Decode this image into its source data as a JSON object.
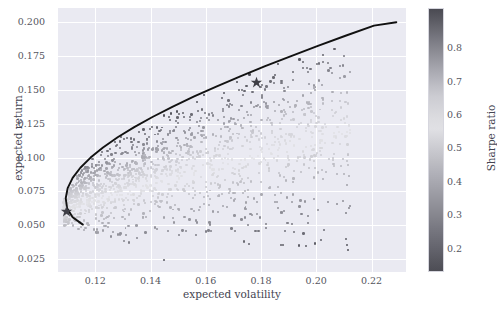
{
  "chart_data": {
    "type": "scatter",
    "title": "",
    "xlabel": "expected volatility",
    "ylabel": "expected return",
    "xlim": [
      0.1065,
      0.2325
    ],
    "ylim": [
      0.0155,
      0.2105
    ],
    "xticks": [
      "0.12",
      "0.14",
      "0.16",
      "0.18",
      "0.20",
      "0.22"
    ],
    "xtick_values": [
      0.12,
      0.14,
      0.16,
      0.18,
      0.2,
      0.22
    ],
    "yticks": [
      "0.025",
      "0.050",
      "0.075",
      "0.100",
      "0.125",
      "0.150",
      "0.175",
      "0.200"
    ],
    "ytick_values": [
      0.025,
      0.05,
      0.075,
      0.1,
      0.125,
      0.15,
      0.175,
      0.2
    ],
    "grid": true,
    "background": "#eaeaf2",
    "gridline_color": "#ffffff",
    "colorbar": {
      "label": "Sharpe ratio",
      "ticks": [
        "0.8",
        "0.7",
        "0.6",
        "0.5",
        "0.4",
        "0.3",
        "0.2"
      ],
      "tick_values": [
        0.8,
        0.7,
        0.6,
        0.5,
        0.4,
        0.3,
        0.2
      ],
      "vmin": 0.13,
      "vmax": 0.92,
      "colormap": "grayscale-diverging",
      "position": "right",
      "stops": [
        {
          "pos": 0.0,
          "color": "#4d4d55"
        },
        {
          "pos": 0.18,
          "color": "#7d7d86"
        },
        {
          "pos": 0.4,
          "color": "#b8b8bf"
        },
        {
          "pos": 0.55,
          "color": "#e2e2e6"
        },
        {
          "pos": 0.68,
          "color": "#c9c9d0"
        },
        {
          "pos": 0.84,
          "color": "#8b8b94"
        },
        {
          "pos": 1.0,
          "color": "#4a4a52"
        }
      ]
    },
    "series": [
      {
        "name": "random portfolios",
        "marker": "circle",
        "colored_by": "Sharpe ratio",
        "n_points": 3000,
        "x_range": [
          0.108,
          0.213
        ],
        "y_range": [
          0.024,
          0.172
        ],
        "description": "cloud of randomly weighted portfolios shaded by Sharpe ratio"
      },
      {
        "name": "efficient frontier",
        "marker": "line",
        "color": "#111111",
        "linewidth": 1.8,
        "points": [
          [
            0.1155,
            0.0505
          ],
          [
            0.1118,
            0.056
          ],
          [
            0.1098,
            0.0625
          ],
          [
            0.1093,
            0.07
          ],
          [
            0.11,
            0.0775
          ],
          [
            0.1118,
            0.085
          ],
          [
            0.1146,
            0.0925
          ],
          [
            0.1183,
            0.1
          ],
          [
            0.1228,
            0.1075
          ],
          [
            0.1281,
            0.115
          ],
          [
            0.1341,
            0.1225
          ],
          [
            0.1407,
            0.13
          ],
          [
            0.1479,
            0.1375
          ],
          [
            0.1556,
            0.145
          ],
          [
            0.1638,
            0.1525
          ],
          [
            0.1725,
            0.16
          ],
          [
            0.1815,
            0.1675
          ],
          [
            0.1909,
            0.175
          ],
          [
            0.2006,
            0.1825
          ],
          [
            0.2106,
            0.19
          ],
          [
            0.2209,
            0.1975
          ],
          [
            0.229,
            0.2
          ]
        ]
      },
      {
        "name": "minimum volatility portfolio",
        "marker": "star",
        "color": "#3f3f47",
        "x": 0.1096,
        "y": 0.06
      },
      {
        "name": "maximum sharpe portfolio",
        "marker": "star",
        "color": "#3f3f47",
        "x": 0.1782,
        "y": 0.1553
      }
    ]
  }
}
